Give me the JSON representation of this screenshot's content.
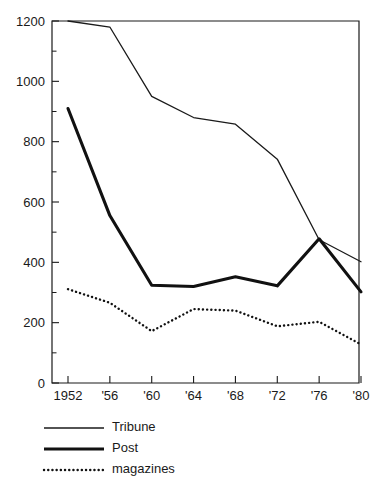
{
  "chart_data": {
    "type": "line",
    "title": "",
    "subtitle": "",
    "xlabel": "",
    "ylabel": "",
    "x": [
      1952,
      1956,
      1960,
      1964,
      1968,
      1972,
      1976,
      1980
    ],
    "xtick_labels": [
      "1952",
      "'56",
      "'60",
      "'64",
      "'68",
      "'72",
      "'76",
      "'80"
    ],
    "ytick_labels": [
      "0",
      "200",
      "400",
      "600",
      "800",
      "1000",
      "1200"
    ],
    "ytick_values": [
      0,
      200,
      400,
      600,
      800,
      1000,
      1200
    ],
    "yminor_step": 100,
    "xlim": [
      1952,
      1980
    ],
    "ylim": [
      0,
      1200
    ],
    "grid": false,
    "legend_position": "below-left",
    "series": [
      {
        "name": "Tribune",
        "style": "thin-solid",
        "color": "#1a1a1a",
        "values": [
          1200,
          1180,
          950,
          880,
          858,
          742,
          475,
          402
        ]
      },
      {
        "name": "Post",
        "style": "thick-solid",
        "color": "#111111",
        "values": [
          910,
          555,
          324,
          320,
          352,
          322,
          478,
          302
        ]
      },
      {
        "name": "magazines",
        "style": "dotted",
        "color": "#111111",
        "values": [
          311,
          266,
          172,
          245,
          240,
          188,
          203,
          128
        ]
      }
    ]
  },
  "legend": {
    "items": [
      {
        "label": "Tribune",
        "style": "thin-solid"
      },
      {
        "label": "Post",
        "style": "thick-solid"
      },
      {
        "label": "magazines",
        "style": "dotted"
      }
    ]
  },
  "axes": {
    "y_top_label": "1200",
    "y_bottom_label": "0"
  }
}
